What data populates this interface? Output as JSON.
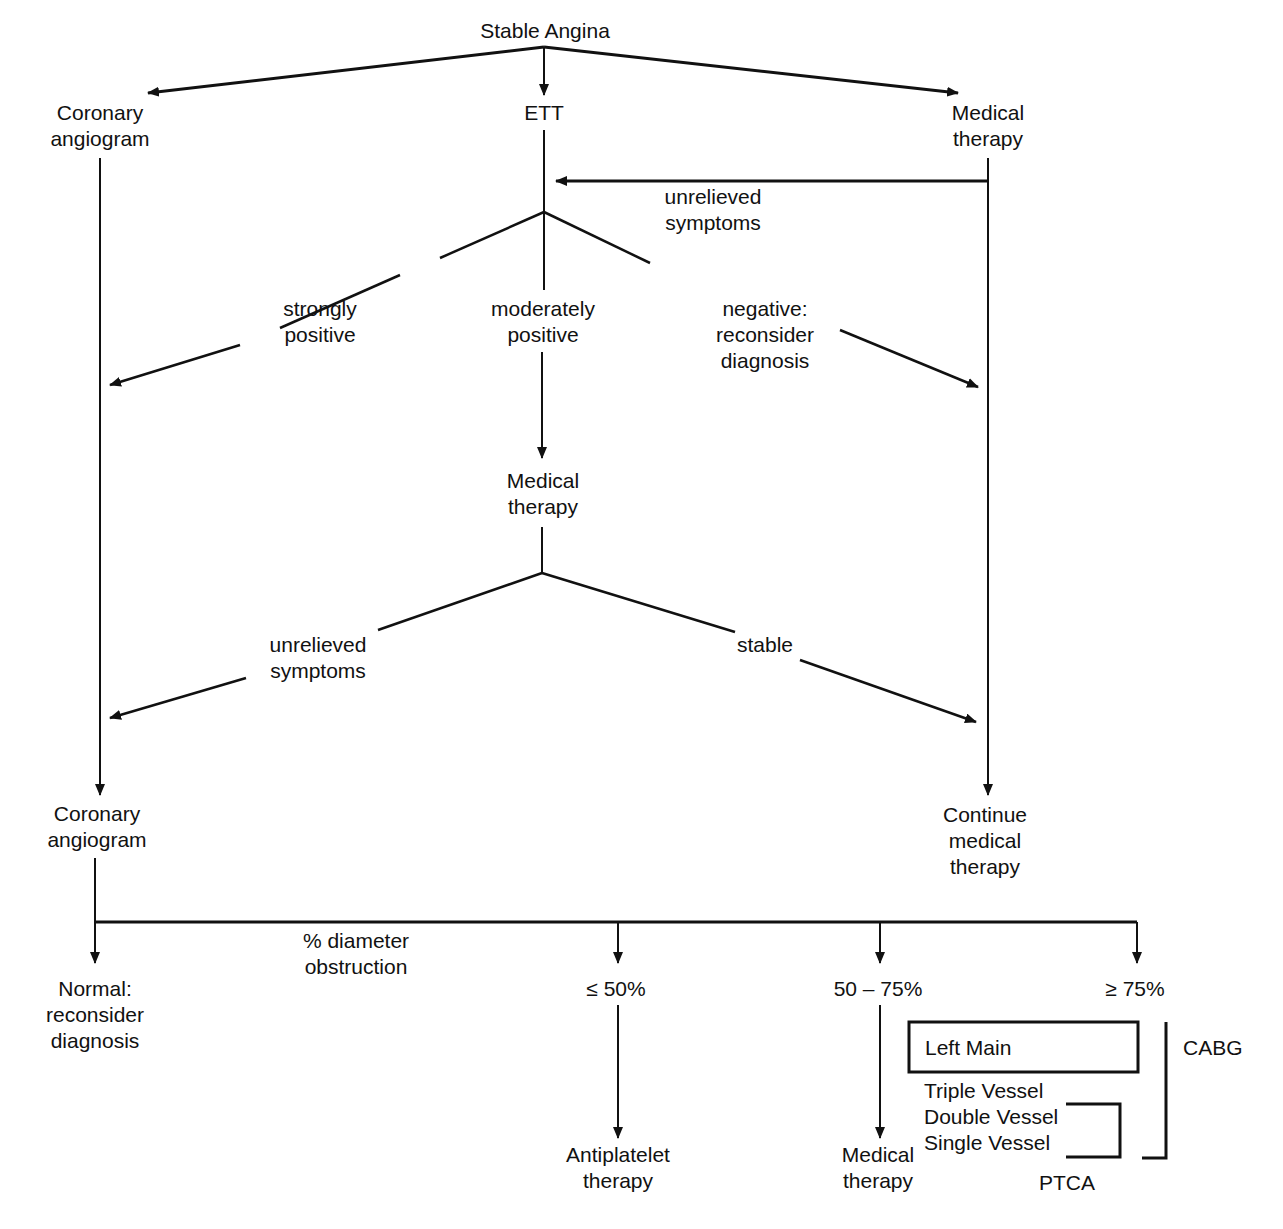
{
  "title": "Stable Angina",
  "nodes": {
    "root": "Stable Angina",
    "coronary_angiogram_top": "Coronary\nangiogram",
    "ett": "ETT",
    "medical_therapy_top": "Medical\ntherapy",
    "unrelieved_symptoms_top": "unrelieved\nsymptoms",
    "strongly_positive": "strongly\npositive",
    "moderately_positive": "moderately\npositive",
    "negative": "negative:\nreconsider\ndiagnosis",
    "medical_therapy_mid": "Medical\ntherapy",
    "unrelieved_symptoms_mid": "unrelieved\nsymptoms",
    "stable": "stable",
    "coronary_angiogram_bottom": "Coronary\nangiogram",
    "continue_medical_therapy": "Continue\nmedical\ntherapy",
    "diameter_obstruction": "% diameter\nobstruction",
    "normal": "Normal:\nreconsider\ndiagnosis",
    "le50": "≤ 50%",
    "range50_75": "50 – 75%",
    "ge75": "≥ 75%",
    "antiplatelet": "Antiplatelet\ntherapy",
    "medical_therapy_bottom": "Medical\ntherapy",
    "left_main": "Left Main",
    "cabg": "CABG",
    "triple_vessel": "Triple Vessel",
    "double_vessel": "Double Vessel",
    "single_vessel": "Single Vessel",
    "ptca": "PTCA"
  }
}
